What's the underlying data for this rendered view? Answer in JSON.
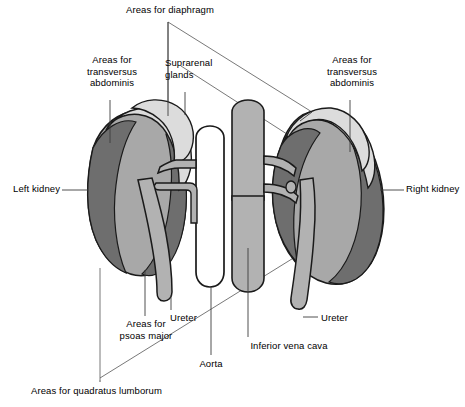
{
  "figure": {
    "background": "#ffffff",
    "outline_color": "#1a1a1a",
    "leader_color": "#555555"
  },
  "palette": {
    "dark_gray": "#6e6e6e",
    "mid_gray": "#a8a8a8",
    "light_gray": "#dcdcdc",
    "vessel_gray": "#b2b2b2",
    "white": "#ffffff",
    "outline": "#1a1a1a",
    "leader": "#555555"
  },
  "labels": {
    "diaphragm": "Areas for diaphragm",
    "transversus_left": "Areas for\ntransversus\nabdominis",
    "transversus_right": "Areas for\ntransversus\nabdominis",
    "suprarenal": "Suprarenal\nglands",
    "left_kidney": "Left kidney",
    "right_kidney": "Right kidney",
    "psoas": "Areas for\npsoas major",
    "ureter_left": "Ureter",
    "ureter_right": "Ureter",
    "aorta": "Aorta",
    "inferior_vena_cava": "Inferior vena cava",
    "quadratus": "Areas for quadratus lumborum"
  },
  "structures": [
    {
      "key": "left-kidney",
      "name": "Left kidney",
      "fill": "#a8a8a8"
    },
    {
      "key": "right-kidney",
      "name": "Right kidney",
      "fill": "#a8a8a8"
    },
    {
      "key": "left-suprarenal-gland",
      "name": "Suprarenal gland (left)",
      "fill": "#dcdcdc"
    },
    {
      "key": "right-suprarenal-gland",
      "name": "Suprarenal gland (right)",
      "fill": "#dcdcdc"
    },
    {
      "key": "aorta",
      "name": "Aorta",
      "fill": "#ffffff"
    },
    {
      "key": "inferior-vena-cava",
      "name": "Inferior vena cava",
      "fill": "#b2b2b2"
    },
    {
      "key": "left-ureter",
      "name": "Left ureter",
      "fill": "#b2b2b2"
    },
    {
      "key": "right-ureter",
      "name": "Right ureter",
      "fill": "#b2b2b2"
    },
    {
      "key": "renal-vessels",
      "name": "Renal vessels",
      "fill": "#b2b2b2"
    }
  ],
  "shaded_areas": [
    {
      "key": "area-diaphragm",
      "name": "Areas for diaphragm",
      "fill": "#dcdcdc"
    },
    {
      "key": "area-transversus-abdominis",
      "name": "Areas for transversus abdominis",
      "fill": "#6e6e6e"
    },
    {
      "key": "area-psoas-major",
      "name": "Areas for psoas major",
      "fill": "#6e6e6e"
    },
    {
      "key": "area-quadratus-lumborum",
      "name": "Areas for quadratus lumborum",
      "fill": "#a8a8a8"
    }
  ]
}
